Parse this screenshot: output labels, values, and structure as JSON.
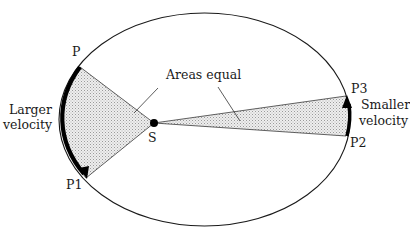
{
  "diagram": {
    "title_fragment": "",
    "labels": {
      "areas_equal": "Areas equal",
      "larger_velocity_line1": "Larger",
      "larger_velocity_line2": "velocity",
      "smaller_velocity_line1": "Smaller",
      "smaller_velocity_line2": "velocity",
      "focus": "S",
      "point_p": "P",
      "point_p1": "P1",
      "point_p2": "P2",
      "point_p3": "P3"
    },
    "ellipse": {
      "cx": 204.5,
      "cy": 119.5,
      "rx": 145.5,
      "ry": 106.5
    },
    "focus_point": {
      "x": 154,
      "y": 123
    },
    "points": {
      "P": {
        "x": 80,
        "y": 67
      },
      "P1": {
        "x": 86,
        "y": 178
      },
      "P2": {
        "x": 346,
        "y": 136
      },
      "P3": {
        "x": 346,
        "y": 96
      }
    },
    "colors": {
      "stroke": "#1a1a1a",
      "fill_shaded": "#d8d8d8",
      "arc_bold": "#000000"
    }
  }
}
